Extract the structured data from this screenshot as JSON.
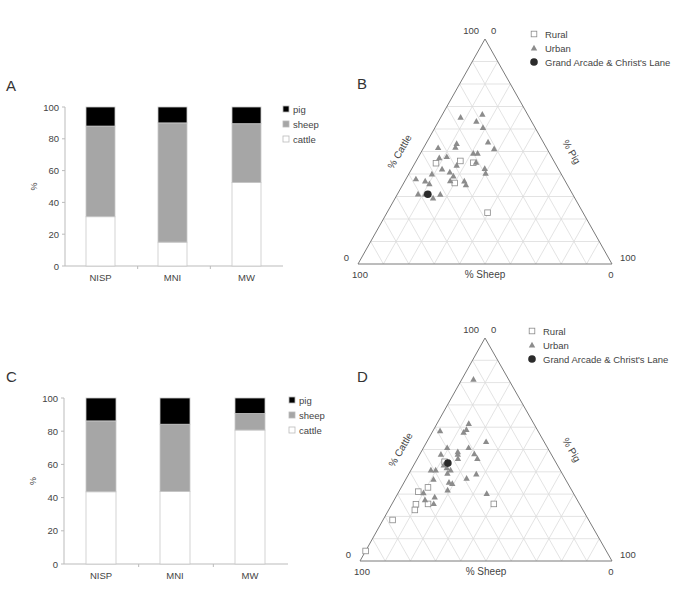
{
  "panels": {
    "A": {
      "label": "A"
    },
    "B": {
      "label": "B"
    },
    "C": {
      "label": "C"
    },
    "D": {
      "label": "D"
    }
  },
  "colors": {
    "pig": "#000000",
    "sheep": "#a6a6a6",
    "cattle": "#ffffff",
    "rural": "#ffffff",
    "urban": "#8c8c8c",
    "grand_arcade": "#2b2b2b",
    "grid": "#dcdcdc",
    "frame": "#7a7a7a",
    "text": "#444444"
  },
  "ternary_labels": {
    "top_left": "100",
    "top_right": "0",
    "left_side": "0",
    "bottom_left": "100",
    "right_side": "100",
    "bottom_right": "0",
    "cattle_axis": "% Cattle",
    "pig_axis": "% Pig",
    "sheep_axis": "% Sheep"
  },
  "ternary_legend": [
    {
      "key": "rural",
      "label": "Rural"
    },
    {
      "key": "urban",
      "label": "Urban"
    },
    {
      "key": "grand_arcade",
      "label": "Grand Arcade & Christ's Lane"
    }
  ],
  "chart_data": [
    {
      "panel": "A",
      "type": "bar",
      "stacked": true,
      "title": "",
      "xlabel": "",
      "ylabel": "%",
      "ylim": [
        0,
        100
      ],
      "yticks": [
        0,
        20,
        40,
        60,
        80,
        100
      ],
      "categories": [
        "NISP",
        "MNI",
        "MW"
      ],
      "series": [
        {
          "name": "cattle",
          "values": [
            31,
            15,
            52.5
          ]
        },
        {
          "name": "sheep",
          "values": [
            57,
            75,
            37
          ]
        },
        {
          "name": "pig",
          "values": [
            12,
            10,
            10.5
          ]
        }
      ],
      "legend": [
        "pig",
        "sheep",
        "cattle"
      ],
      "legend_position": "right"
    },
    {
      "panel": "B",
      "type": "scatter",
      "subtype": "ternary",
      "axes": [
        "% Cattle",
        "% Sheep",
        "% Pig"
      ],
      "apex_top": "cattle",
      "apex_left": "sheep",
      "apex_right": "pig",
      "grid_divisions": 10,
      "series": [
        {
          "name": "Rural",
          "marker": "square",
          "points": [
            {
              "cattle": 44.8,
              "sheep": 46.9,
              "pig": 8.3
            },
            {
              "cattle": 45.8,
              "sheep": 36.8,
              "pig": 17.4
            },
            {
              "cattle": 45.0,
              "sheep": 32.1,
              "pig": 22.9
            },
            {
              "cattle": 36.0,
              "sheep": 43.9,
              "pig": 20.1
            },
            {
              "cattle": 22.8,
              "sheep": 37.6,
              "pig": 39.6
            }
          ]
        },
        {
          "name": "Urban",
          "marker": "triangle",
          "points": [
            {
              "cattle": 65.2,
              "sheep": 27.0,
              "pig": 7.8
            },
            {
              "cattle": 66.5,
              "sheep": 17.8,
              "pig": 15.7
            },
            {
              "cattle": 63.4,
              "sheep": 21.7,
              "pig": 14.9
            },
            {
              "cattle": 60.6,
              "sheep": 20.5,
              "pig": 18.9
            },
            {
              "cattle": 51.7,
              "sheep": 42.6,
              "pig": 5.7
            },
            {
              "cattle": 53.5,
              "sheep": 34.4,
              "pig": 12.1
            },
            {
              "cattle": 51.9,
              "sheep": 35.7,
              "pig": 12.4
            },
            {
              "cattle": 54.2,
              "sheep": 21.7,
              "pig": 24.1
            },
            {
              "cattle": 51.2,
              "sheep": 20.8,
              "pig": 28.0
            },
            {
              "cattle": 49.2,
              "sheep": 30.0,
              "pig": 20.8
            },
            {
              "cattle": 49.2,
              "sheep": 28.3,
              "pig": 22.5
            },
            {
              "cattle": 47.2,
              "sheep": 44.4,
              "pig": 8.4
            },
            {
              "cattle": 47.7,
              "sheep": 41.2,
              "pig": 11.1
            },
            {
              "cattle": 45.2,
              "sheep": 30.9,
              "pig": 23.9
            },
            {
              "cattle": 43.9,
              "sheep": 39.2,
              "pig": 16.9
            },
            {
              "cattle": 42.2,
              "sheep": 45.8,
              "pig": 12.0
            },
            {
              "cattle": 40.9,
              "sheep": 43.4,
              "pig": 15.7
            },
            {
              "cattle": 42.4,
              "sheep": 28.9,
              "pig": 28.7
            },
            {
              "cattle": 40.3,
              "sheep": 29.6,
              "pig": 30.1
            },
            {
              "cattle": 40.0,
              "sheep": 50.9,
              "pig": 9.1
            },
            {
              "cattle": 39.1,
              "sheep": 42.9,
              "pig": 18.0
            },
            {
              "cattle": 37.8,
              "sheep": 58.3,
              "pig": 3.9
            },
            {
              "cattle": 36.9,
              "sheep": 55.1,
              "pig": 8.0
            },
            {
              "cattle": 35.6,
              "sheep": 54.1,
              "pig": 10.3
            },
            {
              "cattle": 37.0,
              "sheep": 45.2,
              "pig": 17.8
            },
            {
              "cattle": 36.9,
              "sheep": 39.7,
              "pig": 23.4
            },
            {
              "cattle": 35.2,
              "sheep": 39.9,
              "pig": 24.9
            },
            {
              "cattle": 31.1,
              "sheep": 60.8,
              "pig": 8.1
            },
            {
              "cattle": 31.1,
              "sheep": 58.0,
              "pig": 10.9
            },
            {
              "cattle": 29.3,
              "sheep": 55.8,
              "pig": 14.9
            },
            {
              "cattle": 31.0,
              "sheep": 52.1,
              "pig": 16.9
            }
          ]
        },
        {
          "name": "Grand Arcade & Christ's Lane",
          "marker": "circle",
          "points": [
            {
              "cattle": 31.0,
              "sheep": 57.0,
              "pig": 12.0
            }
          ]
        }
      ]
    },
    {
      "panel": "C",
      "type": "bar",
      "stacked": true,
      "title": "",
      "xlabel": "",
      "ylabel": "%",
      "ylim": [
        0,
        100
      ],
      "yticks": [
        0,
        20,
        40,
        60,
        80,
        100
      ],
      "categories": [
        "NISP",
        "MNI",
        "MW"
      ],
      "series": [
        {
          "name": "cattle",
          "values": [
            43.5,
            43.7,
            80.7
          ]
        },
        {
          "name": "sheep",
          "values": [
            42.7,
            40.5,
            9.9
          ]
        },
        {
          "name": "pig",
          "values": [
            13.8,
            15.8,
            9.4
          ]
        }
      ],
      "legend": [
        "pig",
        "sheep",
        "cattle"
      ],
      "legend_position": "right"
    },
    {
      "panel": "D",
      "type": "scatter",
      "subtype": "ternary",
      "axes": [
        "% Cattle",
        "% Sheep",
        "% Pig"
      ],
      "apex_top": "cattle",
      "apex_left": "sheep",
      "apex_right": "pig",
      "grid_divisions": 10,
      "series": [
        {
          "name": "Rural",
          "marker": "square",
          "points": [
            {
              "cattle": 31.1,
              "sheep": 61.2,
              "pig": 7.7
            },
            {
              "cattle": 33.0,
              "sheep": 56.4,
              "pig": 10.6
            },
            {
              "cattle": 25.4,
              "sheep": 65.0,
              "pig": 9.6
            },
            {
              "cattle": 22.9,
              "sheep": 66.7,
              "pig": 10.4
            },
            {
              "cattle": 25.6,
              "sheep": 60.1,
              "pig": 14.3
            },
            {
              "cattle": 18.4,
              "sheep": 77.8,
              "pig": 3.8
            },
            {
              "cattle": 25.6,
              "sheep": 34.0,
              "pig": 40.4
            },
            {
              "cattle": 4.5,
              "sheep": 95.5,
              "pig": 0.0
            },
            {
              "cattle": 44.5,
              "sheep": 44.0,
              "pig": 11.5
            }
          ]
        },
        {
          "name": "Urban",
          "marker": "triangle",
          "points": [
            {
              "cattle": 81.5,
              "sheep": 13.9,
              "pig": 4.6
            },
            {
              "cattle": 61.6,
              "sheep": 25.8,
              "pig": 12.6
            },
            {
              "cattle": 58.9,
              "sheep": 28.1,
              "pig": 13.0
            },
            {
              "cattle": 57.7,
              "sheep": 29.8,
              "pig": 12.5
            },
            {
              "cattle": 58.4,
              "sheep": 38.8,
              "pig": 2.8
            },
            {
              "cattle": 53.5,
              "sheep": 23.0,
              "pig": 23.5
            },
            {
              "cattle": 50.8,
              "sheep": 39.8,
              "pig": 9.4
            },
            {
              "cattle": 49.0,
              "sheep": 36.5,
              "pig": 14.5
            },
            {
              "cattle": 47.8,
              "sheep": 37.1,
              "pig": 15.1
            },
            {
              "cattle": 50.8,
              "sheep": 31.3,
              "pig": 17.9
            },
            {
              "cattle": 48.1,
              "sheep": 30.4,
              "pig": 21.5
            },
            {
              "cattle": 45.9,
              "sheep": 30.3,
              "pig": 23.8
            },
            {
              "cattle": 47.8,
              "sheep": 43.8,
              "pig": 8.4
            },
            {
              "cattle": 45.9,
              "sheep": 38.0,
              "pig": 16.1
            },
            {
              "cattle": 43.0,
              "sheep": 45.1,
              "pig": 11.9
            },
            {
              "cattle": 40.8,
              "sheep": 51.3,
              "pig": 7.9
            },
            {
              "cattle": 40.8,
              "sheep": 49.4,
              "pig": 9.8
            },
            {
              "cattle": 40.8,
              "sheep": 43.5,
              "pig": 15.7
            },
            {
              "cattle": 39.3,
              "sheep": 45.5,
              "pig": 15.2
            },
            {
              "cattle": 39.0,
              "sheep": 34.2,
              "pig": 26.8
            },
            {
              "cattle": 37.1,
              "sheep": 39.0,
              "pig": 23.9
            },
            {
              "cattle": 36.6,
              "sheep": 52.4,
              "pig": 11.0
            },
            {
              "cattle": 35.3,
              "sheep": 46.9,
              "pig": 17.8
            },
            {
              "cattle": 34.7,
              "sheep": 45.9,
              "pig": 19.4
            },
            {
              "cattle": 31.8,
              "sheep": 49.2,
              "pig": 19.0
            },
            {
              "cattle": 30.2,
              "sheep": 34.5,
              "pig": 35.3
            },
            {
              "cattle": 30.6,
              "sheep": 59.4,
              "pig": 10.0
            },
            {
              "cattle": 28.7,
              "sheep": 55.9,
              "pig": 15.4
            },
            {
              "cattle": 27.4,
              "sheep": 60.4,
              "pig": 12.2
            },
            {
              "cattle": 25.7,
              "sheep": 57.8,
              "pig": 16.5
            },
            {
              "cattle": 41.8,
              "sheep": 44.5,
              "pig": 13.7
            }
          ]
        },
        {
          "name": "Grand Arcade & Christ's Lane",
          "marker": "circle",
          "points": [
            {
              "cattle": 43.9,
              "sheep": 43.0,
              "pig": 13.1
            }
          ]
        }
      ]
    }
  ]
}
